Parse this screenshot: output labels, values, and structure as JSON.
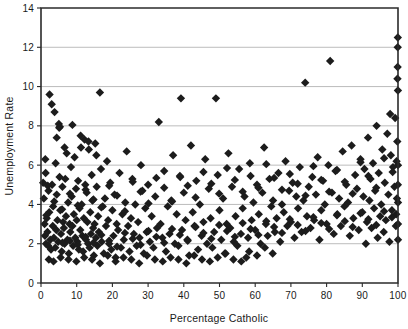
{
  "chart_data": {
    "type": "scatter",
    "title": "",
    "xlabel": "Percentage Catholic",
    "ylabel": "Unemployment Rate",
    "xlim": [
      0,
      100
    ],
    "ylim": [
      0,
      14
    ],
    "xticks": [
      0,
      10,
      20,
      30,
      40,
      50,
      60,
      70,
      80,
      90,
      100
    ],
    "yticks": [
      0,
      2,
      4,
      6,
      8,
      10,
      12,
      14
    ],
    "grid": "horizontal",
    "legend": "none",
    "marker": "diamond",
    "marker_color": "#1c1c1c",
    "marker_size": 4.2,
    "points": [
      [
        0.6,
        5.1
      ],
      [
        0.8,
        4.3
      ],
      [
        1.0,
        3.0
      ],
      [
        1.1,
        2.4
      ],
      [
        1.3,
        5.6
      ],
      [
        1.4,
        2.0
      ],
      [
        1.6,
        3.3
      ],
      [
        1.8,
        2.6
      ],
      [
        2.0,
        1.9
      ],
      [
        2.1,
        4.7
      ],
      [
        2.3,
        3.6
      ],
      [
        2.4,
        9.6
      ],
      [
        2.6,
        2.2
      ],
      [
        2.8,
        1.7
      ],
      [
        3.0,
        9.1
      ],
      [
        3.1,
        5.0
      ],
      [
        3.3,
        2.9
      ],
      [
        3.4,
        3.9
      ],
      [
        3.6,
        2.3
      ],
      [
        3.8,
        8.7
      ],
      [
        4.0,
        1.8
      ],
      [
        4.1,
        6.1
      ],
      [
        4.3,
        2.7
      ],
      [
        4.4,
        4.5
      ],
      [
        4.6,
        3.2
      ],
      [
        4.8,
        2.1
      ],
      [
        5.0,
        8.1
      ],
      [
        5.1,
        7.9
      ],
      [
        5.2,
        5.4
      ],
      [
        5.4,
        3.7
      ],
      [
        5.6,
        2.5
      ],
      [
        5.8,
        1.6
      ],
      [
        6.0,
        4.9
      ],
      [
        6.2,
        3.1
      ],
      [
        6.4,
        2.8
      ],
      [
        6.6,
        2.0
      ],
      [
        6.8,
        5.3
      ],
      [
        7.0,
        3.4
      ],
      [
        7.2,
        6.6
      ],
      [
        7.4,
        2.2
      ],
      [
        7.6,
        4.1
      ],
      [
        7.8,
        1.5
      ],
      [
        8.0,
        3.0
      ],
      [
        8.2,
        2.6
      ],
      [
        8.4,
        5.9
      ],
      [
        8.6,
        4.4
      ],
      [
        8.8,
        2.9
      ],
      [
        9.0,
        1.9
      ],
      [
        9.2,
        3.5
      ],
      [
        9.4,
        6.4
      ],
      [
        9.6,
        2.3
      ],
      [
        9.8,
        4.8
      ],
      [
        10.0,
        3.2
      ],
      [
        10.2,
        2.1
      ],
      [
        10.4,
        5.2
      ],
      [
        10.6,
        1.7
      ],
      [
        10.8,
        3.8
      ],
      [
        11.0,
        2.7
      ],
      [
        11.2,
        6.9
      ],
      [
        11.4,
        4.0
      ],
      [
        11.6,
        2.4
      ],
      [
        11.8,
        1.6
      ],
      [
        12.0,
        3.3
      ],
      [
        12.2,
        7.3
      ],
      [
        12.4,
        5.0
      ],
      [
        12.6,
        2.2
      ],
      [
        12.8,
        4.6
      ],
      [
        13.0,
        3.1
      ],
      [
        13.2,
        2.0
      ],
      [
        13.4,
        6.8
      ],
      [
        13.6,
        1.8
      ],
      [
        13.8,
        3.6
      ],
      [
        14.0,
        2.5
      ],
      [
        14.2,
        5.5
      ],
      [
        14.4,
        4.2
      ],
      [
        14.6,
        2.8
      ],
      [
        14.8,
        1.4
      ],
      [
        15.0,
        3.0
      ],
      [
        15.2,
        7.1
      ],
      [
        15.4,
        2.3
      ],
      [
        15.6,
        4.9
      ],
      [
        15.8,
        1.9
      ],
      [
        16.0,
        3.4
      ],
      [
        16.2,
        2.6
      ],
      [
        16.5,
        9.7
      ],
      [
        16.8,
        5.8
      ],
      [
        17.0,
        2.1
      ],
      [
        17.3,
        3.9
      ],
      [
        17.6,
        1.5
      ],
      [
        17.9,
        4.3
      ],
      [
        18.2,
        2.9
      ],
      [
        18.5,
        6.2
      ],
      [
        18.8,
        3.2
      ],
      [
        19.1,
        2.0
      ],
      [
        19.4,
        5.1
      ],
      [
        19.7,
        1.7
      ],
      [
        20.0,
        3.7
      ],
      [
        20.3,
        2.4
      ],
      [
        20.6,
        4.5
      ],
      [
        20.9,
        1.3
      ],
      [
        21.2,
        3.0
      ],
      [
        21.6,
        2.7
      ],
      [
        22.0,
        5.6
      ],
      [
        22.4,
        1.8
      ],
      [
        22.8,
        3.5
      ],
      [
        23.2,
        2.2
      ],
      [
        23.6,
        4.1
      ],
      [
        24.0,
        6.7
      ],
      [
        24.4,
        2.9
      ],
      [
        24.8,
        1.6
      ],
      [
        25.2,
        3.3
      ],
      [
        25.6,
        5.3
      ],
      [
        26.0,
        2.5
      ],
      [
        26.4,
        4.0
      ],
      [
        26.8,
        1.9
      ],
      [
        27.2,
        3.1
      ],
      [
        27.6,
        2.3
      ],
      [
        28.0,
        6.0
      ],
      [
        28.4,
        4.7
      ],
      [
        28.8,
        1.5
      ],
      [
        29.2,
        3.8
      ],
      [
        29.6,
        2.6
      ],
      [
        30.0,
        5.0
      ],
      [
        30.5,
        2.1
      ],
      [
        31.0,
        3.4
      ],
      [
        31.5,
        1.8
      ],
      [
        32.0,
        4.4
      ],
      [
        32.5,
        2.8
      ],
      [
        33.0,
        8.2
      ],
      [
        33.5,
        3.0
      ],
      [
        34.0,
        2.3
      ],
      [
        34.5,
        5.7
      ],
      [
        35.0,
        1.6
      ],
      [
        35.5,
        3.9
      ],
      [
        36.0,
        2.5
      ],
      [
        36.5,
        4.2
      ],
      [
        37.0,
        6.5
      ],
      [
        37.5,
        2.0
      ],
      [
        38.0,
        3.5
      ],
      [
        38.5,
        1.9
      ],
      [
        39.0,
        5.4
      ],
      [
        39.5,
        2.7
      ],
      [
        40.0,
        4.6
      ],
      [
        40.5,
        3.2
      ],
      [
        41.0,
        2.2
      ],
      [
        41.5,
        1.4
      ],
      [
        42.0,
        7.0
      ],
      [
        42.5,
        3.6
      ],
      [
        43.0,
        2.9
      ],
      [
        43.5,
        5.2
      ],
      [
        44.0,
        1.7
      ],
      [
        44.5,
        4.0
      ],
      [
        45.0,
        2.4
      ],
      [
        45.5,
        3.1
      ],
      [
        46.0,
        6.3
      ],
      [
        46.5,
        2.0
      ],
      [
        47.0,
        4.8
      ],
      [
        47.5,
        3.3
      ],
      [
        48.0,
        1.8
      ],
      [
        48.5,
        2.6
      ],
      [
        49.0,
        9.4
      ],
      [
        49.5,
        5.5
      ],
      [
        50.0,
        3.7
      ],
      [
        50.5,
        2.2
      ],
      [
        51.0,
        4.3
      ],
      [
        51.5,
        1.5
      ],
      [
        52.0,
        3.0
      ],
      [
        52.5,
        6.6
      ],
      [
        53.0,
        2.8
      ],
      [
        53.5,
        4.9
      ],
      [
        54.0,
        2.1
      ],
      [
        54.5,
        3.4
      ],
      [
        55.0,
        1.9
      ],
      [
        55.5,
        5.8
      ],
      [
        56.0,
        2.5
      ],
      [
        56.5,
        3.8
      ],
      [
        57.0,
        4.4
      ],
      [
        57.5,
        1.3
      ],
      [
        58.0,
        2.3
      ],
      [
        58.5,
        6.1
      ],
      [
        59.0,
        3.2
      ],
      [
        59.5,
        4.1
      ],
      [
        60.0,
        2.7
      ],
      [
        60.5,
        5.0
      ],
      [
        61.0,
        3.5
      ],
      [
        61.5,
        2.0
      ],
      [
        62.0,
        4.6
      ],
      [
        62.5,
        6.9
      ],
      [
        63.0,
        3.0
      ],
      [
        63.5,
        2.4
      ],
      [
        64.0,
        5.3
      ],
      [
        64.5,
        3.9
      ],
      [
        65.0,
        4.2
      ],
      [
        65.5,
        2.6
      ],
      [
        66.0,
        3.3
      ],
      [
        66.5,
        5.6
      ],
      [
        67.0,
        2.1
      ],
      [
        67.5,
        4.0
      ],
      [
        68.0,
        3.6
      ],
      [
        68.5,
        6.2
      ],
      [
        69.0,
        2.9
      ],
      [
        69.5,
        4.7
      ],
      [
        70.0,
        3.1
      ],
      [
        70.5,
        5.1
      ],
      [
        71.0,
        2.3
      ],
      [
        71.5,
        4.4
      ],
      [
        72.0,
        3.8
      ],
      [
        72.5,
        5.9
      ],
      [
        73.0,
        2.6
      ],
      [
        73.5,
        4.2
      ],
      [
        74.0,
        10.2
      ],
      [
        74.5,
        3.4
      ],
      [
        75.0,
        4.9
      ],
      [
        75.5,
        2.8
      ],
      [
        76.0,
        5.4
      ],
      [
        76.5,
        3.2
      ],
      [
        77.0,
        4.5
      ],
      [
        77.5,
        6.4
      ],
      [
        78.0,
        2.2
      ],
      [
        78.5,
        3.7
      ],
      [
        79.0,
        5.2
      ],
      [
        79.5,
        4.0
      ],
      [
        80.0,
        3.0
      ],
      [
        80.5,
        6.0
      ],
      [
        81.0,
        11.3
      ],
      [
        81.5,
        4.6
      ],
      [
        82.0,
        2.5
      ],
      [
        82.5,
        5.7
      ],
      [
        83.0,
        3.5
      ],
      [
        83.5,
        4.3
      ],
      [
        84.0,
        2.9
      ],
      [
        84.5,
        6.7
      ],
      [
        85.0,
        3.9
      ],
      [
        85.5,
        5.0
      ],
      [
        86.0,
        4.1
      ],
      [
        86.5,
        2.4
      ],
      [
        87.0,
        7.0
      ],
      [
        87.5,
        3.3
      ],
      [
        88.0,
        5.5
      ],
      [
        88.5,
        4.8
      ],
      [
        89.0,
        2.7
      ],
      [
        89.5,
        6.3
      ],
      [
        90.0,
        3.6
      ],
      [
        90.3,
        4.4
      ],
      [
        90.6,
        5.8
      ],
      [
        91.0,
        2.0
      ],
      [
        91.3,
        3.1
      ],
      [
        91.6,
        7.4
      ],
      [
        92.0,
        4.2
      ],
      [
        92.3,
        5.3
      ],
      [
        92.6,
        2.8
      ],
      [
        93.0,
        6.1
      ],
      [
        93.3,
        3.8
      ],
      [
        93.6,
        4.7
      ],
      [
        94.0,
        8.0
      ],
      [
        94.3,
        2.3
      ],
      [
        94.6,
        5.6
      ],
      [
        95.0,
        3.4
      ],
      [
        95.3,
        4.0
      ],
      [
        95.6,
        6.8
      ],
      [
        96.0,
        2.6
      ],
      [
        96.3,
        5.1
      ],
      [
        96.6,
        3.2
      ],
      [
        97.0,
        7.6
      ],
      [
        97.3,
        4.5
      ],
      [
        97.6,
        2.1
      ],
      [
        98.0,
        6.5
      ],
      [
        98.3,
        3.7
      ],
      [
        98.6,
        5.9
      ],
      [
        99.0,
        4.9
      ],
      [
        99.2,
        8.4
      ],
      [
        99.4,
        2.9
      ],
      [
        99.5,
        3.5
      ],
      [
        99.6,
        6.2
      ],
      [
        99.7,
        4.3
      ],
      [
        99.8,
        7.2
      ],
      [
        99.85,
        10.4
      ],
      [
        99.9,
        11.0
      ],
      [
        99.92,
        12.0
      ],
      [
        99.95,
        12.5
      ],
      [
        99.97,
        5.0
      ],
      [
        99.98,
        9.8
      ],
      [
        100.0,
        2.2
      ],
      [
        100.0,
        3.0
      ],
      [
        100.0,
        4.1
      ],
      [
        100.0,
        6.0
      ],
      [
        2.2,
        1.2
      ],
      [
        3.5,
        1.1
      ],
      [
        5.5,
        1.3
      ],
      [
        7.7,
        1.2
      ],
      [
        9.9,
        1.1
      ],
      [
        12.1,
        1.3
      ],
      [
        14.3,
        1.2
      ],
      [
        16.5,
        1.0
      ],
      [
        18.7,
        1.4
      ],
      [
        20.9,
        1.1
      ],
      [
        23.1,
        1.3
      ],
      [
        25.3,
        1.2
      ],
      [
        27.5,
        1.0
      ],
      [
        29.7,
        1.4
      ],
      [
        31.9,
        1.2
      ],
      [
        34.1,
        1.1
      ],
      [
        36.3,
        1.3
      ],
      [
        38.5,
        1.2
      ],
      [
        40.7,
        1.0
      ],
      [
        42.9,
        1.4
      ],
      [
        45.1,
        1.2
      ],
      [
        47.3,
        1.1
      ],
      [
        49.5,
        1.3
      ],
      [
        51.7,
        1.5
      ],
      [
        53.9,
        1.2
      ],
      [
        56.1,
        1.1
      ],
      [
        58.3,
        1.6
      ],
      [
        60.5,
        1.4
      ],
      [
        62.7,
        1.8
      ],
      [
        64.9,
        1.5
      ],
      [
        6.0,
        2.05
      ],
      [
        8.1,
        2.15
      ],
      [
        10.3,
        1.95
      ],
      [
        12.5,
        2.35
      ],
      [
        14.7,
        2.05
      ],
      [
        16.9,
        2.45
      ],
      [
        19.1,
        2.15
      ],
      [
        21.3,
        1.85
      ],
      [
        23.5,
        2.55
      ],
      [
        25.7,
        2.25
      ],
      [
        27.9,
        1.95
      ],
      [
        30.1,
        2.65
      ],
      [
        32.3,
        2.35
      ],
      [
        34.5,
        2.05
      ],
      [
        36.7,
        2.75
      ],
      [
        38.9,
        2.45
      ],
      [
        41.1,
        2.15
      ],
      [
        43.3,
        2.85
      ],
      [
        45.5,
        2.55
      ],
      [
        47.7,
        2.25
      ],
      [
        49.9,
        2.95
      ],
      [
        52.1,
        2.65
      ],
      [
        54.3,
        2.35
      ],
      [
        56.5,
        3.05
      ],
      [
        58.7,
        2.75
      ],
      [
        60.9,
        2.45
      ],
      [
        63.1,
        3.15
      ],
      [
        65.3,
        2.85
      ],
      [
        67.5,
        2.55
      ],
      [
        69.7,
        3.25
      ],
      [
        71.9,
        2.95
      ],
      [
        74.1,
        2.65
      ],
      [
        76.3,
        3.35
      ],
      [
        78.5,
        3.05
      ],
      [
        80.7,
        2.75
      ],
      [
        82.9,
        3.45
      ],
      [
        85.1,
        3.15
      ],
      [
        87.3,
        2.85
      ],
      [
        89.5,
        3.55
      ],
      [
        91.7,
        3.25
      ],
      [
        93.9,
        2.95
      ],
      [
        96.1,
        3.65
      ],
      [
        98.3,
        3.35
      ],
      [
        1.5,
        3.45
      ],
      [
        3.7,
        4.15
      ],
      [
        5.9,
        3.75
      ],
      [
        8.1,
        4.55
      ],
      [
        10.3,
        3.95
      ],
      [
        12.5,
        4.75
      ],
      [
        14.7,
        4.25
      ],
      [
        16.9,
        3.85
      ],
      [
        19.1,
        4.95
      ],
      [
        21.3,
        4.45
      ],
      [
        23.5,
        3.65
      ],
      [
        25.7,
        5.15
      ],
      [
        27.9,
        4.65
      ],
      [
        30.1,
        4.05
      ],
      [
        32.3,
        5.35
      ],
      [
        34.5,
        4.85
      ],
      [
        36.7,
        4.15
      ],
      [
        38.9,
        5.45
      ],
      [
        41.1,
        4.95
      ],
      [
        43.3,
        4.35
      ],
      [
        45.5,
        5.65
      ],
      [
        47.7,
        5.05
      ],
      [
        49.9,
        4.55
      ],
      [
        52.1,
        5.85
      ],
      [
        54.3,
        5.25
      ],
      [
        56.5,
        4.65
      ],
      [
        58.7,
        5.45
      ],
      [
        60.9,
        4.85
      ],
      [
        63.1,
        6.05
      ],
      [
        65.3,
        5.35
      ],
      [
        67.5,
        4.75
      ],
      [
        69.7,
        5.55
      ],
      [
        71.9,
        5.05
      ],
      [
        74.1,
        4.45
      ],
      [
        76.3,
        5.95
      ],
      [
        78.5,
        5.25
      ],
      [
        80.7,
        4.65
      ],
      [
        82.9,
        5.75
      ],
      [
        85.1,
        5.15
      ],
      [
        87.3,
        4.55
      ],
      [
        89.5,
        6.15
      ],
      [
        91.7,
        5.45
      ],
      [
        93.9,
        4.85
      ],
      [
        96.1,
        6.35
      ],
      [
        98.5,
        5.65
      ],
      [
        1.2,
        6.3
      ],
      [
        4.4,
        7.4
      ],
      [
        6.6,
        6.9
      ],
      [
        11.1,
        7.5
      ],
      [
        13.3,
        7.2
      ],
      [
        15.5,
        6.5
      ],
      [
        39.2,
        9.4
      ],
      [
        8.8,
        8.05
      ],
      [
        5.3,
        7.95
      ],
      [
        1.9,
        4.95
      ],
      [
        97.8,
        8.6
      ]
    ]
  },
  "axes": {
    "y_tick_labels": [
      "14",
      "12",
      "10",
      "8",
      "6",
      "4",
      "2",
      "0"
    ],
    "x_tick_labels": [
      "0",
      "10",
      "20",
      "30",
      "40",
      "50",
      "60",
      "70",
      "80",
      "90",
      "100"
    ]
  },
  "colors": {
    "marker": "#1c1c1c",
    "grid": "#b4b4b4",
    "spine": "#2b2b2b",
    "background": "#ffffff",
    "text": "#1a1a1a"
  }
}
